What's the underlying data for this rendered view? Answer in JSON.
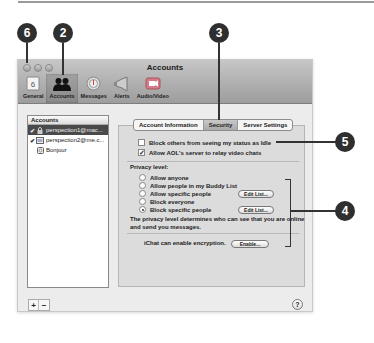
{
  "callouts": [
    {
      "label": "6",
      "target": "close-button"
    },
    {
      "label": "2",
      "target": "toolbar-accounts"
    },
    {
      "label": "3",
      "target": "tab-security"
    },
    {
      "label": "5",
      "target": "security-checkboxes"
    },
    {
      "label": "4",
      "target": "privacy-level-group"
    }
  ],
  "window": {
    "title": "Accounts",
    "toolbar": [
      {
        "label": "General",
        "icon": "general-icon"
      },
      {
        "label": "Accounts",
        "icon": "accounts-icon",
        "active": true
      },
      {
        "label": "Messages",
        "icon": "messages-icon"
      },
      {
        "label": "Alerts",
        "icon": "alerts-icon"
      },
      {
        "label": "Audio/Video",
        "icon": "audio-video-icon"
      }
    ]
  },
  "accounts": {
    "header": "Accounts",
    "items": [
      {
        "label": "perspection1@mac...",
        "checked": true,
        "selected": true,
        "icon": "lock-icon"
      },
      {
        "label": "perspection2@me.c...",
        "checked": true,
        "selected": false,
        "icon": "account-icon"
      },
      {
        "label": "Bonjour",
        "checked": false,
        "selected": false,
        "icon": "bonjour-icon"
      }
    ],
    "add_label": "+",
    "remove_label": "−"
  },
  "tabs": [
    {
      "label": "Account Information",
      "active": false
    },
    {
      "label": "Security",
      "active": true
    },
    {
      "label": "Server Settings",
      "active": false
    }
  ],
  "security": {
    "block_idle": {
      "label": "Block others from seeing my status as Idle",
      "checked": false
    },
    "allow_aol": {
      "label": "Allow AOL's server to relay video chats",
      "checked": true
    },
    "privacy_label": "Privacy level:",
    "privacy_options": [
      {
        "label": "Allow anyone",
        "selected": false
      },
      {
        "label": "Allow people in my Buddy List",
        "selected": false
      },
      {
        "label": "Allow specific people",
        "selected": false,
        "button": "Edit List..."
      },
      {
        "label": "Block everyone",
        "selected": false
      },
      {
        "label": "Block specific people",
        "selected": true,
        "button": "Edit List..."
      }
    ],
    "privacy_desc": "The privacy level determines who can see that you are online and send you messages.",
    "encryption_label": "iChat can enable encryption.",
    "encryption_button": "Enable..."
  },
  "help_label": "?"
}
